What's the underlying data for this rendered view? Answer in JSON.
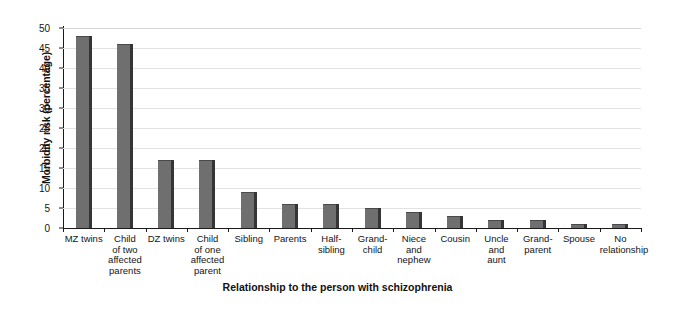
{
  "chart_data": {
    "type": "bar",
    "title": "",
    "xlabel": "Relationship to the person with schizophrenia",
    "ylabel": "Morbidity risk (percentage)",
    "ylim": [
      0,
      50
    ],
    "ytick_step": 5,
    "yticks": [
      "0",
      "5",
      "10",
      "15",
      "20",
      "25",
      "30",
      "35",
      "40",
      "45",
      "50"
    ],
    "grid": true,
    "legend": "none",
    "bar_color": "#6f6f6f",
    "bar_edge_color": "#353535",
    "gridline_color": "#e2e2e2",
    "axis_color": "#1a1a1a",
    "categories": [
      "MZ twins",
      "Child of two affected parents",
      "DZ twins",
      "Child of one affected parent",
      "Sibling",
      "Parents",
      "Half-sibling",
      "Grand-child",
      "Niece and nephew",
      "Cousin",
      "Uncle and aunt",
      "Grand-parent",
      "Spouse",
      "No relationship"
    ],
    "category_lines": [
      [
        "MZ twins"
      ],
      [
        "Child",
        "of two",
        "affected",
        "parents"
      ],
      [
        "DZ twins"
      ],
      [
        "Child",
        "of one",
        "affected",
        "parent"
      ],
      [
        "Sibling"
      ],
      [
        "Parents"
      ],
      [
        "Half-",
        "sibling"
      ],
      [
        "Grand-",
        "child"
      ],
      [
        "Niece",
        "and",
        "nephew"
      ],
      [
        "Cousin"
      ],
      [
        "Uncle",
        "and",
        "aunt"
      ],
      [
        "Grand-",
        "parent"
      ],
      [
        "Spouse"
      ],
      [
        "No",
        "relationship"
      ]
    ],
    "values": [
      48,
      46,
      17,
      17,
      9,
      6,
      6,
      5,
      4,
      3,
      2,
      2,
      1,
      1
    ]
  }
}
